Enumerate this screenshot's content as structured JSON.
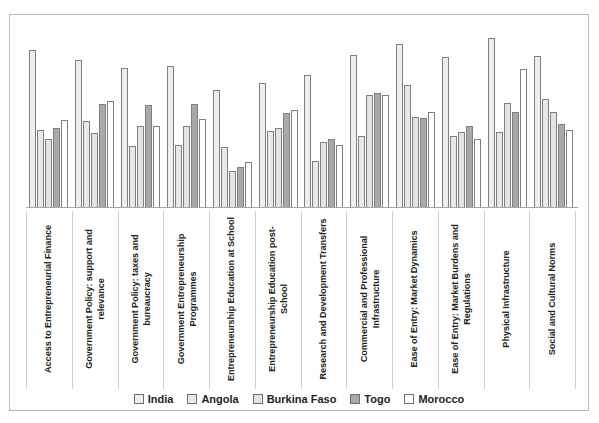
{
  "chart_data": {
    "type": "bar",
    "title": "",
    "subtitle": "",
    "xlabel": "",
    "ylabel": "",
    "ylim": [
      0,
      4.2
    ],
    "grid": false,
    "legend_position": "bottom",
    "categories": [
      "Access to Entrepreneurial Finance",
      "Government Policy: support and relevance",
      "Government Policy: taxes and bureaucracy",
      "Government Entrepreneurship Programmes",
      "Entrepreneurship Education at School",
      "Entrepreneurship Education post-School",
      "Research and Development Transfers",
      "Commercial and Professional Infrastructure",
      "Ease of Entry: Market Dynamics",
      "Ease of Entry: Market Burdens and Regulations",
      "Physical Infrastructure",
      "Social and Cultural Norms"
    ],
    "series": [
      {
        "name": "India",
        "color": "#eeeeee",
        "values": [
          3.7,
          3.48,
          3.29,
          3.34,
          2.77,
          2.93,
          3.13,
          3.59,
          3.84,
          3.54,
          4.0,
          3.57
        ]
      },
      {
        "name": "Angola",
        "color": "#e8e8e8",
        "values": [
          1.84,
          2.05,
          1.45,
          1.48,
          1.43,
          1.81,
          1.1,
          1.7,
          2.88,
          1.7,
          1.78,
          2.55
        ]
      },
      {
        "name": "Burkina Faso",
        "color": "#e3e3e3",
        "values": [
          1.62,
          1.75,
          1.92,
          1.92,
          0.88,
          1.87,
          1.54,
          2.66,
          2.14,
          1.78,
          2.47,
          2.25
        ]
      },
      {
        "name": "Togo",
        "color": "#a9a9a9",
        "values": [
          1.87,
          2.44,
          2.41,
          2.44,
          0.96,
          2.22,
          1.62,
          2.71,
          2.11,
          1.92,
          2.25,
          1.97
        ]
      },
      {
        "name": "Morocco",
        "color": "#ffffff",
        "values": [
          2.06,
          2.52,
          1.92,
          2.08,
          1.07,
          2.3,
          1.48,
          2.66,
          2.25,
          1.62,
          3.26,
          1.84
        ]
      }
    ]
  },
  "legend": {
    "items": [
      {
        "label": "India",
        "swatch": "#eeeeee"
      },
      {
        "label": "Angola",
        "swatch": "#e8e8e8"
      },
      {
        "label": "Burkina Faso",
        "swatch": "#e3e3e3"
      },
      {
        "label": "Togo",
        "swatch": "#a9a9a9"
      },
      {
        "label": "Morocco",
        "swatch": "#ffffff"
      }
    ]
  }
}
